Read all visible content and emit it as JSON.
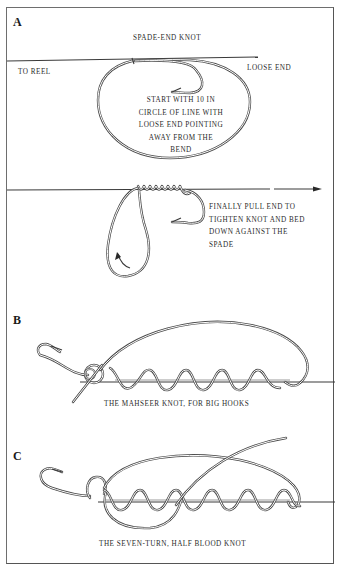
{
  "figure": {
    "sections": [
      {
        "letter": "A",
        "title": "SPADE-END KNOT",
        "labels": {
          "to_reel": "TO REEL",
          "loose_end": "LOOSE END",
          "start_note": [
            "START WITH 10 IN",
            "CIRCLE OF LINE WITH",
            "LOOSE END POINTING",
            "AWAY FROM THE",
            "BEND"
          ],
          "finish_note": [
            "FINALLY PULL END TO",
            "TIGHTEN KNOT AND BED",
            "DOWN AGAINST THE",
            "SPADE"
          ]
        }
      },
      {
        "letter": "B",
        "caption": "THE MAHSEER KNOT, FOR BIG HOOKS",
        "turns": 5
      },
      {
        "letter": "C",
        "caption": "THE SEVEN-TURN, HALF BLOOD KNOT",
        "turns": 7
      }
    ],
    "colors": {
      "ink": "#3a3a3a",
      "paper": "#ffffff",
      "frame": "#6e6e6e"
    }
  }
}
